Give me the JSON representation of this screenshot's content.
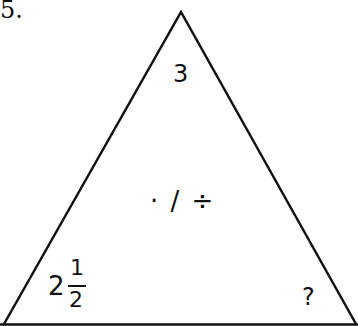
{
  "problem_number": "5.",
  "triangle": {
    "top": "3",
    "center_operations": "· / ÷",
    "bottom_left": {
      "whole": "2",
      "numerator": "1",
      "denominator": "2"
    },
    "bottom_right": "?"
  },
  "colors": {
    "stroke": "#111111",
    "background": "#ffffff"
  }
}
